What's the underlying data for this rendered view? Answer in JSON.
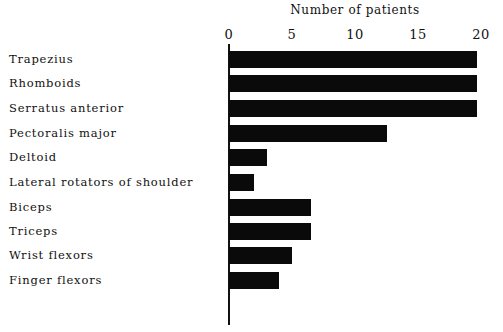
{
  "chart_data": {
    "type": "bar",
    "orientation": "horizontal",
    "title": "Number of patients",
    "xlabel": "Number of patients",
    "ylabel": "",
    "xlim": [
      0,
      20
    ],
    "x_ticks": [
      "0",
      "5",
      "10",
      "15",
      "20"
    ],
    "grid": false,
    "legend": null,
    "categories": [
      "Trapezius",
      "Rhomboids",
      "Serratus anterior",
      "Pectoralis major",
      "Deltoid",
      "Lateral rotators of shoulder",
      "Biceps",
      "Triceps",
      "Wrist flexors",
      "Finger flexors"
    ],
    "values": [
      20,
      20,
      20,
      12.5,
      3,
      2,
      6.5,
      6.5,
      5,
      4
    ],
    "bar_color": "#0a0a0a"
  }
}
